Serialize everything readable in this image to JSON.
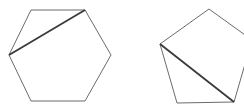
{
  "figure": {
    "background_color": "#ffffff",
    "canvas": {
      "width": 244,
      "height": 110
    },
    "outline_color": "#6b6b6b",
    "outline_width": 1,
    "diagonal_color": "#3a3a3a",
    "diagonal_width": 1.8,
    "shapes": [
      {
        "name": "hexagon",
        "label": "hexagon",
        "sides": 6,
        "points": "31,10 85,10 111,55 85,101 31,101 9,55",
        "vertices": [
          {
            "x": 31,
            "y": 10,
            "name": "top-left"
          },
          {
            "x": 85,
            "y": 10,
            "name": "top-right"
          },
          {
            "x": 111,
            "y": 55,
            "name": "right"
          },
          {
            "x": 85,
            "y": 101,
            "name": "bottom-right"
          },
          {
            "x": 31,
            "y": 101,
            "name": "bottom-left"
          },
          {
            "x": 9,
            "y": 55,
            "name": "left"
          }
        ],
        "diagonal": {
          "name": "hexagon-diagonal",
          "from": {
            "x": 9,
            "y": 55,
            "name": "left"
          },
          "to": {
            "x": 85,
            "y": 10,
            "name": "top-right"
          }
        },
        "clipped": false
      },
      {
        "name": "pentagon",
        "label": "pentagon",
        "sides": 5,
        "points": "209,9 252,40 234,102 177,103 160,44",
        "vertices": [
          {
            "x": 209,
            "y": 9,
            "name": "top"
          },
          {
            "x": 252,
            "y": 40,
            "name": "right-clipped"
          },
          {
            "x": 234,
            "y": 102,
            "name": "bottom-right"
          },
          {
            "x": 177,
            "y": 103,
            "name": "bottom-left"
          },
          {
            "x": 160,
            "y": 44,
            "name": "left"
          }
        ],
        "diagonal": {
          "name": "pentagon-diagonal",
          "from": {
            "x": 160,
            "y": 44,
            "name": "left"
          },
          "to": {
            "x": 234,
            "y": 102,
            "name": "bottom-right"
          }
        },
        "clipped": true,
        "clipped_edge": "right"
      }
    ]
  }
}
